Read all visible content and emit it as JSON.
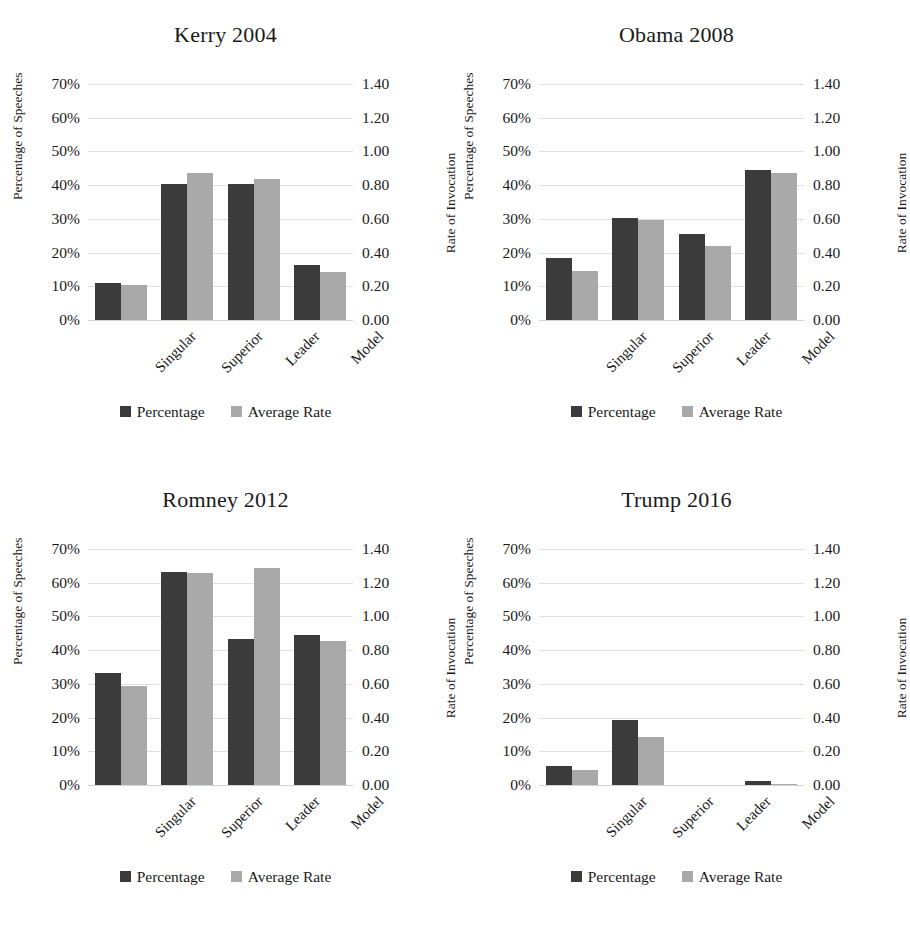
{
  "figure": {
    "axis_left_title": "Percentage of Speeches",
    "axis_right_title": "Rate of Invocation",
    "legend": {
      "percentage_label": "Percentage",
      "average_rate_label": "Average Rate",
      "percentage_color": "#3b3b3b",
      "average_rate_color": "#a9a9a9"
    },
    "left_ticks": [
      "70%",
      "60%",
      "50%",
      "40%",
      "30%",
      "20%",
      "10%",
      "0%"
    ],
    "right_ticks": [
      "1.40",
      "1.20",
      "1.00",
      "0.80",
      "0.60",
      "0.40",
      "0.20",
      "0.00"
    ],
    "categories": [
      "Singular",
      "Superior",
      "Leader",
      "Model"
    ]
  },
  "chart_data": [
    {
      "type": "bar",
      "title": "Kerry 2004",
      "categories": [
        "Singular",
        "Superior",
        "Leader",
        "Model"
      ],
      "series": [
        {
          "name": "Percentage",
          "axis": "left",
          "values": [
            11.0,
            40.2,
            40.3,
            16.3
          ]
        },
        {
          "name": "Average Rate",
          "axis": "right",
          "values": [
            0.205,
            0.875,
            0.835,
            0.285
          ]
        }
      ],
      "xlabel": "",
      "ylabel": "Percentage of Speeches",
      "y2label": "Rate of Invocation",
      "ylim": [
        0,
        70
      ],
      "y2lim": [
        0,
        1.4
      ],
      "grid": true,
      "legend_position": "bottom"
    },
    {
      "type": "bar",
      "title": "Obama 2008",
      "categories": [
        "Singular",
        "Superior",
        "Leader",
        "Model"
      ],
      "series": [
        {
          "name": "Percentage",
          "axis": "left",
          "values": [
            18.5,
            30.2,
            25.5,
            44.4
          ]
        },
        {
          "name": "Average Rate",
          "axis": "right",
          "values": [
            0.29,
            0.595,
            0.44,
            0.875
          ]
        }
      ],
      "xlabel": "",
      "ylabel": "Percentage of Speeches",
      "y2label": "Rate of Invocation",
      "ylim": [
        0,
        70
      ],
      "y2lim": [
        0,
        1.4
      ],
      "grid": true,
      "legend_position": "bottom"
    },
    {
      "type": "bar",
      "title": "Romney 2012",
      "categories": [
        "Singular",
        "Superior",
        "Leader",
        "Model"
      ],
      "series": [
        {
          "name": "Percentage",
          "axis": "left",
          "values": [
            33.2,
            63.2,
            43.4,
            44.4
          ]
        },
        {
          "name": "Average Rate",
          "axis": "right",
          "values": [
            0.585,
            1.255,
            1.29,
            0.855
          ]
        }
      ],
      "xlabel": "",
      "ylabel": "Percentage of Speeches",
      "y2label": "Rate of Invocation",
      "ylim": [
        0,
        70
      ],
      "y2lim": [
        0,
        1.4
      ],
      "grid": true,
      "legend_position": "bottom"
    },
    {
      "type": "bar",
      "title": "Trump 2016",
      "categories": [
        "Singular",
        "Superior",
        "Leader",
        "Model"
      ],
      "series": [
        {
          "name": "Percentage",
          "axis": "left",
          "values": [
            5.5,
            19.2,
            0.0,
            1.3
          ]
        },
        {
          "name": "Average Rate",
          "axis": "right",
          "values": [
            0.09,
            0.285,
            0.0,
            0.005
          ]
        }
      ],
      "xlabel": "",
      "ylabel": "Percentage of Speeches",
      "y2label": "Rate of Invocation",
      "ylim": [
        0,
        70
      ],
      "y2lim": [
        0,
        1.4
      ],
      "grid": true,
      "legend_position": "bottom"
    }
  ]
}
